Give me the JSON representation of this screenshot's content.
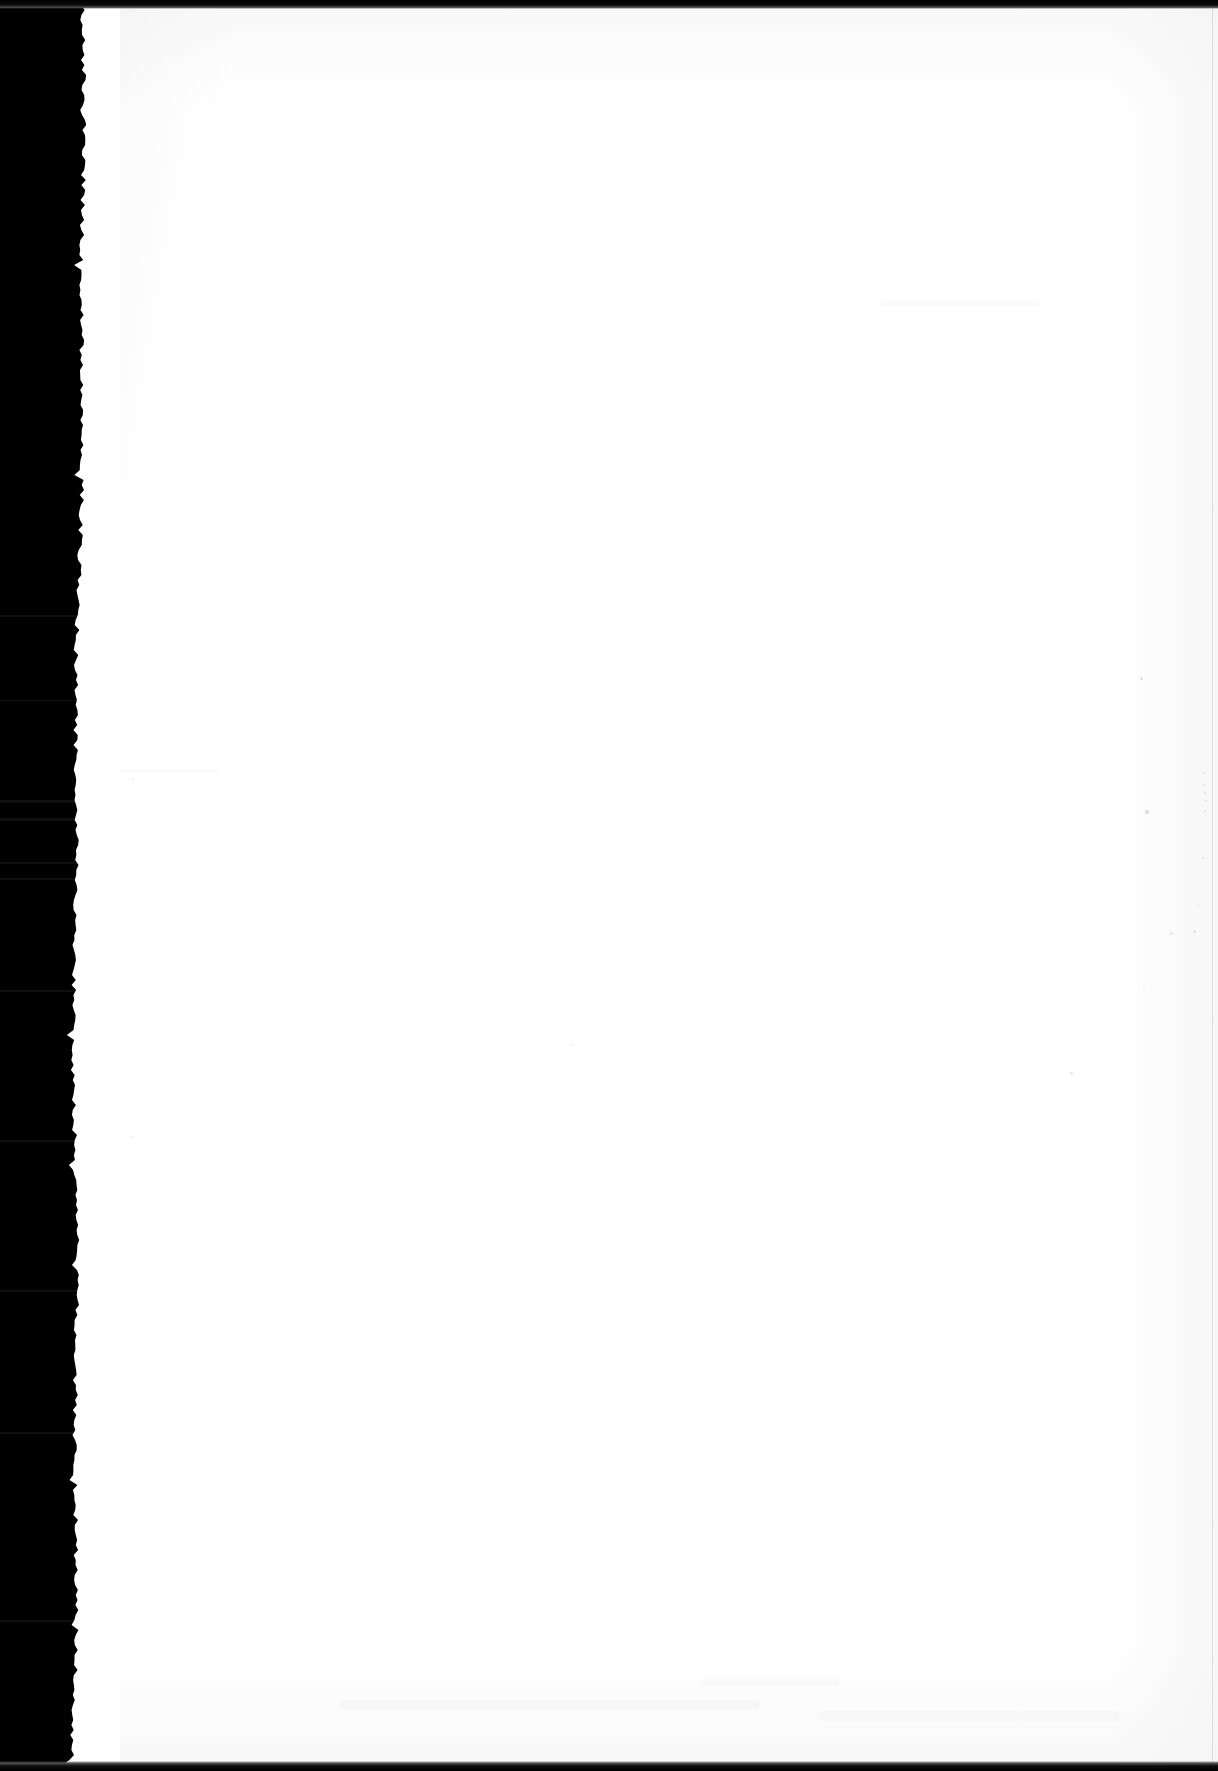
{
  "document": {
    "type": "scanned-page",
    "page_state": "blank",
    "page_text": "",
    "visible_text_count": 0,
    "description_label": "Blank scanned page"
  },
  "canvas": {
    "width_px": 1218,
    "height_px": 1771
  },
  "colors": {
    "gutter_black": "#000000",
    "paper_white": "#ffffff",
    "paper_tone": "#f4f4f5",
    "edge_strip": "#0c0c0c",
    "speck_gray": "#b9b9bf",
    "right_rule_gray": "#d8d8dc"
  },
  "regions": {
    "gutter": {
      "label": "Scanner binding gutter",
      "x": 0,
      "y": 0,
      "width": 86,
      "height": 1771
    },
    "paper": {
      "label": "Paper sheet",
      "x": 70,
      "y": 9,
      "width": 1148,
      "height": 1753
    },
    "top_strip": {
      "label": "Top dark frame strip",
      "height": 9
    },
    "bottom_strip": {
      "label": "Bottom dark frame strip",
      "height": 10
    },
    "right_rule": {
      "label": "Right sheet edge rule",
      "x": 1212
    }
  },
  "gutter_streaks": [
    {
      "top": 615,
      "height": 2
    },
    {
      "top": 700,
      "height": 1
    },
    {
      "top": 800,
      "height": 3
    },
    {
      "top": 818,
      "height": 3
    },
    {
      "top": 862,
      "height": 2
    },
    {
      "top": 878,
      "height": 2
    },
    {
      "top": 990,
      "height": 2
    },
    {
      "top": 1140,
      "height": 2
    },
    {
      "top": 1290,
      "height": 2
    },
    {
      "top": 1432,
      "height": 2
    },
    {
      "top": 1620,
      "height": 2
    }
  ],
  "specks": [
    {
      "x": 1140,
      "y": 677,
      "size": 3,
      "opacity": 0.45
    },
    {
      "x": 1203,
      "y": 772,
      "size": 2,
      "opacity": 0.4
    },
    {
      "x": 1203,
      "y": 784,
      "size": 2,
      "opacity": 0.38
    },
    {
      "x": 1204,
      "y": 792,
      "size": 2,
      "opacity": 0.42
    },
    {
      "x": 1205,
      "y": 800,
      "size": 2,
      "opacity": 0.36
    },
    {
      "x": 1204,
      "y": 810,
      "size": 2,
      "opacity": 0.4
    },
    {
      "x": 1145,
      "y": 810,
      "size": 4,
      "opacity": 0.5
    },
    {
      "x": 1202,
      "y": 857,
      "size": 2,
      "opacity": 0.35
    },
    {
      "x": 1197,
      "y": 905,
      "size": 2,
      "opacity": 0.3
    },
    {
      "x": 1193,
      "y": 930,
      "size": 3,
      "opacity": 0.38
    },
    {
      "x": 1170,
      "y": 932,
      "size": 3,
      "opacity": 0.34
    },
    {
      "x": 1070,
      "y": 1072,
      "size": 3,
      "opacity": 0.35
    },
    {
      "x": 1143,
      "y": 988,
      "size": 2,
      "opacity": 0.28
    },
    {
      "x": 570,
      "y": 1044,
      "size": 2,
      "opacity": 0.22
    },
    {
      "x": 132,
      "y": 778,
      "size": 2,
      "opacity": 0.25
    },
    {
      "x": 130,
      "y": 1136,
      "size": 2,
      "opacity": 0.24
    }
  ],
  "smudges": [
    {
      "x": 100,
      "y": 770,
      "width": 120,
      "height": 2,
      "opacity": 0.55
    },
    {
      "x": 340,
      "y": 1700,
      "width": 420,
      "height": 9,
      "opacity": 0.6
    },
    {
      "x": 820,
      "y": 1712,
      "width": 300,
      "height": 8,
      "opacity": 0.5
    },
    {
      "x": 700,
      "y": 1680,
      "width": 140,
      "height": 6,
      "opacity": 0.45
    },
    {
      "x": 880,
      "y": 300,
      "width": 160,
      "height": 6,
      "opacity": 0.4
    }
  ]
}
